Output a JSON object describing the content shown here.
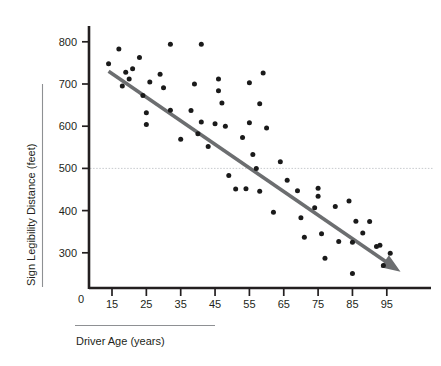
{
  "chart_data": {
    "type": "scatter",
    "title": "",
    "xlabel": "Driver Age (years)",
    "ylabel": "Sign Legibility Distance (feet)",
    "xlim": [
      10,
      100
    ],
    "ylim": [
      0,
      840
    ],
    "grid": false,
    "legend": null,
    "x_ticks": [
      15,
      25,
      35,
      45,
      55,
      65,
      75,
      85,
      95
    ],
    "x_tick_labels": [
      "15",
      "25",
      "35",
      "45",
      "55",
      "65",
      "75",
      "85",
      "95"
    ],
    "y_ticks": [
      300,
      400,
      500,
      600,
      700,
      800
    ],
    "y_tick_labels": [
      "300",
      "400",
      "500",
      "600",
      "700",
      "800"
    ],
    "origin_label": "0",
    "reference_line": {
      "y": 500,
      "style": "dotted",
      "color": "#b9bcc2"
    },
    "trend_line": {
      "style": "arrow",
      "color": "#6c6e70",
      "x_start": 14,
      "y_start": 730,
      "x_end": 99,
      "y_end": 255
    },
    "points": [
      [
        14,
        748
      ],
      [
        17,
        783
      ],
      [
        18,
        695
      ],
      [
        19,
        728
      ],
      [
        20,
        712
      ],
      [
        21,
        736
      ],
      [
        23,
        763
      ],
      [
        24,
        673
      ],
      [
        25,
        632
      ],
      [
        25,
        604
      ],
      [
        26,
        705
      ],
      [
        29,
        723
      ],
      [
        30,
        691
      ],
      [
        32,
        794
      ],
      [
        32,
        638
      ],
      [
        35,
        569
      ],
      [
        38,
        637
      ],
      [
        39,
        700
      ],
      [
        40,
        582
      ],
      [
        41,
        610
      ],
      [
        41,
        794
      ],
      [
        43,
        552
      ],
      [
        45,
        606
      ],
      [
        46,
        712
      ],
      [
        46,
        684
      ],
      [
        47,
        655
      ],
      [
        48,
        600
      ],
      [
        49,
        483
      ],
      [
        51,
        451
      ],
      [
        53,
        573
      ],
      [
        54,
        452
      ],
      [
        55,
        703
      ],
      [
        55,
        608
      ],
      [
        56,
        533
      ],
      [
        57,
        500
      ],
      [
        58,
        653
      ],
      [
        58,
        446
      ],
      [
        59,
        726
      ],
      [
        60,
        596
      ],
      [
        62,
        396
      ],
      [
        64,
        516
      ],
      [
        66,
        472
      ],
      [
        69,
        447
      ],
      [
        70,
        383
      ],
      [
        71,
        337
      ],
      [
        74,
        407
      ],
      [
        75,
        453
      ],
      [
        75,
        434
      ],
      [
        76,
        345
      ],
      [
        77,
        287
      ],
      [
        80,
        410
      ],
      [
        81,
        327
      ],
      [
        84,
        423
      ],
      [
        85,
        251
      ],
      [
        85,
        325
      ],
      [
        86,
        375
      ],
      [
        88,
        347
      ],
      [
        90,
        374
      ],
      [
        92,
        315
      ],
      [
        93,
        318
      ],
      [
        94,
        270
      ],
      [
        96,
        299
      ]
    ]
  },
  "labels": {
    "y_axis_title": "Sign Legibility Distance (feet)",
    "x_axis_title": "Driver Age (years)",
    "origin": "0"
  }
}
